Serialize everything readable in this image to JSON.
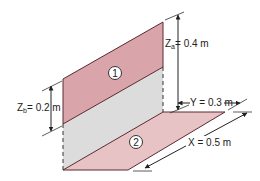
{
  "figure": {
    "surfaces": [
      {
        "id": "1",
        "label": "1",
        "orientation": "vertical"
      },
      {
        "id": "2",
        "label": "2",
        "orientation": "horizontal"
      }
    ],
    "dimensions": {
      "za": {
        "symbol": "Z",
        "subscript": "a",
        "value": "0.4 m",
        "text": "= 0.4 m"
      },
      "zb": {
        "symbol": "Z",
        "subscript": "b",
        "value": "0.2 m",
        "text": "= 0.2 m"
      },
      "y": {
        "symbol": "Y",
        "value": "0.3 m",
        "text": "Y = 0.3 m"
      },
      "x": {
        "symbol": "X",
        "value": "0.5 m",
        "text": "X = 0.5 m"
      }
    },
    "colors": {
      "surface_fill": "#d9a5ab",
      "surface_light_fill": "#e8c3c6",
      "gap_fill": "#dcdcdc",
      "edge": "#5a2a30",
      "line": "#222222"
    }
  }
}
